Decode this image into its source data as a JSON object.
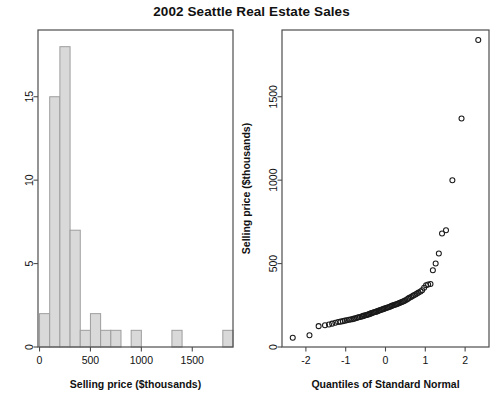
{
  "figure": {
    "title": "2002 Seattle Real Estate Sales"
  },
  "chart_data": [
    {
      "type": "bar",
      "panel": "left",
      "title": "",
      "xlabel": "Selling price ($thousands)",
      "ylabel": "",
      "xlim": [
        -15,
        1900
      ],
      "ylim": [
        0,
        19
      ],
      "xticks": [
        0,
        500,
        1000,
        1500
      ],
      "xtick_labels": [
        "0",
        "500",
        "1000",
        "1500"
      ],
      "yticks": [
        0,
        5,
        10,
        15
      ],
      "ytick_labels": [
        "0",
        "5",
        "10",
        "15"
      ],
      "grid": false,
      "legend": "none",
      "bin_width": 100,
      "bin_edges": [
        0,
        100,
        200,
        300,
        400,
        500,
        600,
        700,
        800,
        900,
        1000,
        1100,
        1200,
        1300,
        1400,
        1500,
        1600,
        1700,
        1800,
        1900
      ],
      "categories": [
        "0-100",
        "100-200",
        "200-300",
        "300-400",
        "400-500",
        "500-600",
        "600-700",
        "700-800",
        "800-900",
        "900-1000",
        "1000-1100",
        "1100-1200",
        "1200-1300",
        "1300-1400",
        "1400-1500",
        "1500-1600",
        "1600-1700",
        "1700-1800",
        "1800-1900"
      ],
      "values": [
        2,
        15,
        18,
        7,
        1,
        2,
        1,
        1,
        0,
        1,
        0,
        0,
        0,
        1,
        0,
        0,
        0,
        0,
        1
      ]
    },
    {
      "type": "scatter",
      "panel": "right",
      "title": "",
      "xlabel": "Quantiles of Standard Normal",
      "ylabel": "Selling price ($thousands)",
      "xlim": [
        -2.6,
        2.6
      ],
      "ylim": [
        0,
        1900
      ],
      "xticks": [
        -2,
        -1,
        0,
        1,
        2
      ],
      "xtick_labels": [
        "-2",
        "-1",
        "0",
        "1",
        "2"
      ],
      "yticks": [
        0,
        500,
        1000,
        1500
      ],
      "ytick_labels": [
        "0",
        "500",
        "1000",
        "1500"
      ],
      "grid": false,
      "legend": "none",
      "marker": "open-circle",
      "x": [
        -2.33,
        -1.91,
        -1.68,
        -1.52,
        -1.42,
        -1.34,
        -1.26,
        -1.19,
        -1.13,
        -1.07,
        -1.02,
        -0.97,
        -0.92,
        -0.88,
        -0.83,
        -0.79,
        -0.75,
        -0.71,
        -0.68,
        -0.64,
        -0.6,
        -0.57,
        -0.54,
        -0.5,
        -0.47,
        -0.44,
        -0.41,
        -0.38,
        -0.35,
        -0.32,
        -0.29,
        -0.26,
        -0.23,
        -0.2,
        -0.17,
        -0.15,
        -0.12,
        -0.09,
        -0.06,
        -0.03,
        0.0,
        0.03,
        0.06,
        0.09,
        0.12,
        0.15,
        0.17,
        0.2,
        0.23,
        0.26,
        0.29,
        0.32,
        0.35,
        0.38,
        0.41,
        0.44,
        0.47,
        0.5,
        0.54,
        0.57,
        0.6,
        0.64,
        0.68,
        0.71,
        0.75,
        0.79,
        0.83,
        0.88,
        0.92,
        0.97,
        1.02,
        1.07,
        1.13,
        1.19,
        1.26,
        1.34,
        1.42,
        1.52,
        1.68,
        1.91,
        2.33
      ],
      "y": [
        55,
        70,
        125,
        130,
        135,
        140,
        145,
        150,
        152,
        155,
        158,
        160,
        163,
        165,
        167,
        170,
        172,
        175,
        178,
        180,
        183,
        185,
        188,
        190,
        192,
        195,
        197,
        200,
        203,
        205,
        208,
        210,
        212,
        215,
        217,
        220,
        222,
        225,
        227,
        230,
        232,
        235,
        237,
        240,
        243,
        245,
        248,
        250,
        253,
        255,
        258,
        261,
        264,
        267,
        270,
        273,
        276,
        280,
        285,
        290,
        295,
        300,
        305,
        310,
        315,
        320,
        326,
        333,
        340,
        355,
        370,
        375,
        378,
        460,
        500,
        560,
        680,
        700,
        1000,
        1370,
        1840
      ]
    }
  ]
}
